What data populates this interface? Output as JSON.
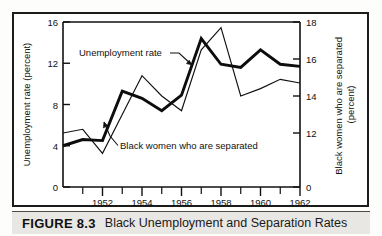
{
  "figure": {
    "number_label": "FIGURE 8.3",
    "caption": "Black Unemployment and Separation Rates"
  },
  "chart_data": {
    "type": "line",
    "title": "",
    "xlabel": "",
    "ylabel": "Unemployment rate (percent)",
    "y2label": "Black women who are separated (percent)",
    "grid": false,
    "legend_position": "inline-annotations",
    "x": [
      1951,
      1952,
      1953,
      1954,
      1955,
      1956,
      1957,
      1958,
      1959,
      1960,
      1961,
      1962,
      1963
    ],
    "xlim": [
      1951,
      1963
    ],
    "xticks_major": [
      1952,
      1954,
      1956,
      1958,
      1960,
      1962
    ],
    "xtick_labels": [
      "1952",
      "1954",
      "1956",
      "1958",
      "1960",
      "1962"
    ],
    "xticks_minor": [
      1951,
      1953,
      1955,
      1957,
      1959,
      1961,
      1963
    ],
    "ylim": [
      0,
      16
    ],
    "yticks": [
      0,
      4,
      8,
      12,
      16
    ],
    "ytick_labels": [
      "0",
      "4",
      "8",
      "12",
      "16"
    ],
    "y2lim": [
      0,
      18
    ],
    "y2ticks": [
      0,
      12,
      14,
      16,
      18
    ],
    "y2tick_labels": [
      "0",
      "12",
      "14",
      "16",
      "18"
    ],
    "y2_axis_note": "right axis is broken: 0 at baseline, then 12 to 18 across upper range",
    "series": [
      {
        "name": "Unemployment rate",
        "axis": "left",
        "style": "thick",
        "values": [
          4.0,
          4.6,
          4.5,
          9.3,
          8.6,
          7.4,
          8.9,
          14.4,
          11.9,
          11.6,
          13.3,
          11.9,
          11.7
        ]
      },
      {
        "name": "Black women who are separated",
        "axis": "right",
        "style": "thin",
        "values": [
          12.0,
          12.2,
          10.9,
          13.0,
          15.1,
          14.0,
          13.2,
          16.5,
          17.7,
          14.0,
          14.4,
          14.9,
          14.7
        ]
      }
    ],
    "annotations": [
      {
        "text": "Unemployment rate",
        "target_series": "Unemployment rate"
      },
      {
        "text": "Black women who are separated",
        "target_series": "Black women who are separated"
      }
    ]
  }
}
